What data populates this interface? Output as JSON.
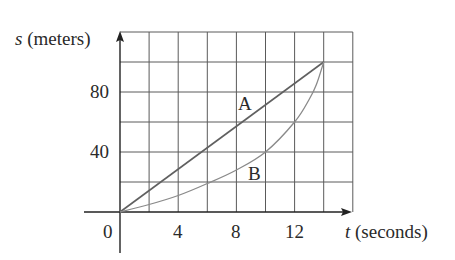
{
  "chart_data": {
    "type": "line",
    "title": "",
    "xlabel": "t (seconds)",
    "ylabel": "s (meters)",
    "xlabel_var": "t",
    "xlabel_unit": "(seconds)",
    "ylabel_var": "s",
    "ylabel_unit": "(meters)",
    "xlim": [
      0,
      16
    ],
    "ylim": [
      0,
      120
    ],
    "x_ticks": [
      0,
      4,
      8,
      12
    ],
    "y_ticks": [
      40,
      80
    ],
    "x_tick_labels": [
      "0",
      "4",
      "8",
      "12"
    ],
    "y_tick_labels": [
      "40",
      "80"
    ],
    "grid": true,
    "grid_x_step": 2,
    "grid_y_step": 20,
    "legend": "none (curves labeled inline)",
    "series": [
      {
        "name": "A",
        "x": [
          0,
          14
        ],
        "y": [
          0,
          100
        ]
      },
      {
        "name": "B",
        "x": [
          0,
          2,
          4,
          6,
          8,
          10,
          12,
          13,
          13.5,
          14
        ],
        "y": [
          0,
          5,
          11,
          19,
          28,
          40,
          60,
          75,
          85,
          100
        ]
      }
    ],
    "annotations": [
      {
        "text": "A",
        "x": 8.8,
        "y": 73
      },
      {
        "text": "B",
        "x": 9.5,
        "y": 26
      }
    ]
  },
  "labels": {
    "y_axis_var": "s",
    "y_axis_unit": "(meters)",
    "x_axis_var": "t",
    "x_axis_unit": "(seconds)",
    "tick_0": "0",
    "tick_x_4": "4",
    "tick_x_8": "8",
    "tick_x_12": "12",
    "tick_y_40": "40",
    "tick_y_80": "80",
    "curve_a": "A",
    "curve_b": "B"
  },
  "colors": {
    "grid": "#5a5a5a",
    "axis": "#222222",
    "line_a": "#606060",
    "line_b": "#8a8a8a",
    "text": "#2a2a2a"
  }
}
